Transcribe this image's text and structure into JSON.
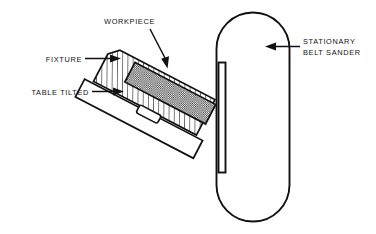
{
  "figure": {
    "background_color": "#ffffff",
    "line_color": "#111111",
    "workpiece_fill": "#8f8f8f",
    "fixture_fill": "#ffffff",
    "table_fill": "#ffffff"
  },
  "labels": {
    "workpiece": "WORKPIECE",
    "fixture": "FIXTURE",
    "table_tilted": "TABLE TILTED",
    "sander_line1": "STATIONARY",
    "sander_line2": "BELT SANDER"
  },
  "parts": {
    "belt_sander": "stationary-belt-sander-body",
    "platen": "sander-platen-bar",
    "workpiece": "workpiece-block",
    "fixture": "fixture-block",
    "table": "tilted-table",
    "fixture_tab": "fixture-locating-tab"
  },
  "leaders": {
    "fixture_arrow": "arrow-right",
    "table_arrow": "arrow-right",
    "workpiece_arrow": "arrow-down",
    "sander_arrow": "arrow-left"
  }
}
